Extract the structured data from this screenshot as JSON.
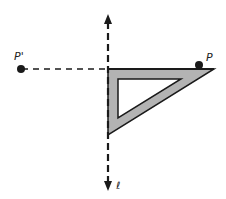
{
  "diagram": {
    "labels": {
      "point": "P",
      "image_point": "P'",
      "line": "ℓ"
    },
    "colors": {
      "stroke": "#1a1a1a",
      "triangle_fill": "#b3b3b3",
      "background": "#ffffff"
    }
  }
}
